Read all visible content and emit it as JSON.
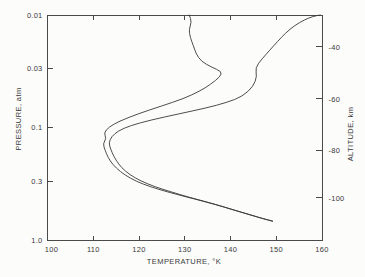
{
  "figure": {
    "background": "#fcfcfa",
    "curve_color": "#39393a",
    "axis_color": "#4a4a4b",
    "text_color": "#3a3a3b"
  },
  "chart_data": {
    "type": "line",
    "title": "",
    "xlabel": "TEMPERATURE, °K",
    "ylabel_left": "PRESSURE, atm",
    "ylabel_right": "ALTITUDE, km",
    "grid": false,
    "legend": null,
    "xlim": [
      100,
      160
    ],
    "x_tick_values": [
      100,
      110,
      120,
      130,
      140,
      150,
      160
    ],
    "x_tick_labels": [
      "100",
      "110",
      "120",
      "130",
      "140",
      "150",
      "160"
    ],
    "y_scale": "log",
    "ylim": [
      0.01,
      1.0
    ],
    "y_tick_values": [
      0.01,
      0.03,
      0.1,
      0.3,
      1.0
    ],
    "y_tick_labels": [
      "0.01",
      "0.03",
      "0.1",
      "0.3",
      "1.0"
    ],
    "right_axis_ticks": [
      {
        "label": "-40",
        "frac": 0.142
      },
      {
        "label": "-60",
        "frac": 0.373
      },
      {
        "label": "-80",
        "frac": 0.602
      },
      {
        "label": "-100",
        "frac": 0.813
      }
    ],
    "series": [
      {
        "name": "cold stratosphere profile",
        "points_TK_atm": [
          [
            131.0,
            0.01
          ],
          [
            131.5,
            0.0116
          ],
          [
            130.9,
            0.0135
          ],
          [
            131.2,
            0.0158
          ],
          [
            131.9,
            0.0188
          ],
          [
            132.5,
            0.0222
          ],
          [
            133.6,
            0.0258
          ],
          [
            135.8,
            0.029
          ],
          [
            138.1,
            0.0318
          ],
          [
            137.8,
            0.0352
          ],
          [
            135.6,
            0.0415
          ],
          [
            133.3,
            0.0475
          ],
          [
            129.8,
            0.0553
          ],
          [
            124.9,
            0.0645
          ],
          [
            119.8,
            0.0755
          ],
          [
            115.9,
            0.0872
          ],
          [
            113.4,
            0.099
          ],
          [
            112.3,
            0.112
          ],
          [
            112.9,
            0.125
          ],
          [
            112.1,
            0.139
          ],
          [
            112.6,
            0.159
          ],
          [
            113.2,
            0.184
          ],
          [
            114.3,
            0.214
          ],
          [
            115.9,
            0.247
          ],
          [
            118.1,
            0.283
          ],
          [
            120.9,
            0.319
          ],
          [
            124.3,
            0.355
          ],
          [
            128.1,
            0.392
          ],
          [
            132.1,
            0.431
          ],
          [
            136.2,
            0.477
          ],
          [
            140.2,
            0.533
          ],
          [
            144.1,
            0.593
          ],
          [
            147.1,
            0.646
          ],
          [
            149.2,
            0.68
          ]
        ]
      },
      {
        "name": "warm stratosphere profile",
        "points_TK_atm": [
          [
            159.6,
            0.01
          ],
          [
            158.0,
            0.0103
          ],
          [
            156.2,
            0.011
          ],
          [
            154.0,
            0.0124
          ],
          [
            152.0,
            0.0145
          ],
          [
            150.3,
            0.0172
          ],
          [
            148.6,
            0.0205
          ],
          [
            146.9,
            0.0245
          ],
          [
            145.4,
            0.0295
          ],
          [
            145.8,
            0.035
          ],
          [
            145.0,
            0.043
          ],
          [
            142.6,
            0.053
          ],
          [
            139.2,
            0.06
          ],
          [
            134.6,
            0.0672
          ],
          [
            128.6,
            0.0758
          ],
          [
            122.6,
            0.0858
          ],
          [
            118.1,
            0.0962
          ],
          [
            115.4,
            0.1075
          ],
          [
            114.0,
            0.1205
          ],
          [
            113.4,
            0.1365
          ],
          [
            113.8,
            0.1555
          ],
          [
            114.5,
            0.1805
          ],
          [
            115.5,
            0.2105
          ],
          [
            117.0,
            0.245
          ],
          [
            119.1,
            0.281
          ],
          [
            121.9,
            0.318
          ],
          [
            125.2,
            0.355
          ],
          [
            128.9,
            0.394
          ],
          [
            132.7,
            0.436
          ],
          [
            136.7,
            0.483
          ],
          [
            140.6,
            0.539
          ],
          [
            144.4,
            0.599
          ],
          [
            147.4,
            0.65
          ],
          [
            149.2,
            0.68
          ]
        ]
      }
    ]
  }
}
